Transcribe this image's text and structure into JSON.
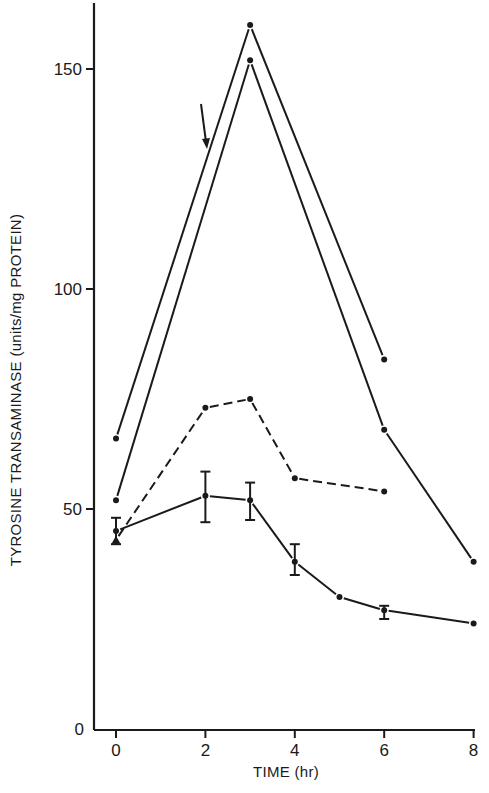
{
  "chart_data": {
    "type": "line",
    "title": "",
    "xlabel": "TIME (hr)",
    "ylabel": "TYROSINE TRANSAMINASE (units/mg PROTEIN)",
    "xlim": [
      -0.5,
      8
    ],
    "ylim": [
      0,
      165
    ],
    "x_ticks": [
      0,
      2,
      4,
      6,
      8
    ],
    "y_ticks": [
      0,
      50,
      100,
      150
    ],
    "grid": false,
    "legend": null,
    "annotations": [
      {
        "type": "arrow",
        "x": 2,
        "y": 130,
        "direction": "down"
      }
    ],
    "series": [
      {
        "name": "upper-solid",
        "style": "solid",
        "marker": "dot",
        "x": [
          0,
          3,
          6
        ],
        "y": [
          66,
          160,
          84
        ]
      },
      {
        "name": "second-solid",
        "style": "solid",
        "marker": "dot",
        "x": [
          0,
          3,
          6,
          8
        ],
        "y": [
          52,
          152,
          68,
          38
        ]
      },
      {
        "name": "dashed",
        "style": "dashed",
        "marker": "dot",
        "x": [
          0,
          2,
          3,
          4,
          6
        ],
        "y": [
          43,
          73,
          75,
          57,
          54
        ]
      },
      {
        "name": "mean-with-error",
        "style": "solid",
        "marker": "dot",
        "x": [
          0,
          2,
          3,
          4,
          5,
          6,
          8
        ],
        "y": [
          45,
          53,
          52,
          38,
          30,
          27,
          24
        ],
        "error_low": [
          42,
          47,
          47.5,
          35,
          null,
          25,
          null
        ],
        "error_high": [
          48,
          58.5,
          56,
          42,
          null,
          28,
          null
        ]
      }
    ]
  },
  "axes": {
    "x_title": "TIME (hr)",
    "y_title": "TYROSINE TRANSAMINASE  (units/mg PROTEIN)",
    "x_tick_labels": [
      "0",
      "2",
      "4",
      "6",
      "8"
    ],
    "y_tick_labels": [
      "0",
      "50",
      "100",
      "150"
    ]
  }
}
